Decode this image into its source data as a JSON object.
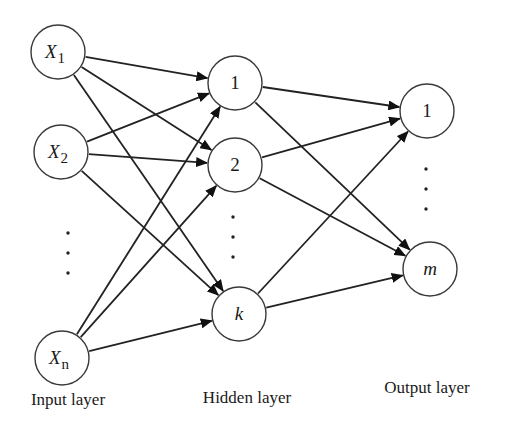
{
  "diagram": {
    "colors": {
      "stroke": "#222222",
      "node_fill": "#ffffff",
      "text": "#1a1a1a",
      "background": "#ffffff"
    },
    "layers": [
      {
        "id": "input",
        "label": "Input layer",
        "label_x": 68,
        "label_y": 405
      },
      {
        "id": "hidden",
        "label": "Hidden layer",
        "label_x": 247,
        "label_y": 403
      },
      {
        "id": "output",
        "label": "Output layer",
        "label_x": 427,
        "label_y": 393
      }
    ],
    "nodes": [
      {
        "id": "x1",
        "layer": "input",
        "main": "X",
        "sub": "1",
        "italic": true,
        "cx": 58,
        "cy": 52,
        "r": 27
      },
      {
        "id": "x2",
        "layer": "input",
        "main": "X",
        "sub": "2",
        "italic": true,
        "cx": 61,
        "cy": 152,
        "r": 27
      },
      {
        "id": "xn",
        "layer": "input",
        "main": "X",
        "sub": "n",
        "italic": true,
        "cx": 62,
        "cy": 358,
        "r": 27
      },
      {
        "id": "h1",
        "layer": "hidden",
        "main": "1",
        "sub": "",
        "italic": false,
        "cx": 235,
        "cy": 83,
        "r": 27
      },
      {
        "id": "h2",
        "layer": "hidden",
        "main": "2",
        "sub": "",
        "italic": false,
        "cx": 235,
        "cy": 165,
        "r": 27
      },
      {
        "id": "hk",
        "layer": "hidden",
        "main": "k",
        "sub": "",
        "italic": true,
        "cx": 239,
        "cy": 314,
        "r": 27
      },
      {
        "id": "o1",
        "layer": "output",
        "main": "1",
        "sub": "",
        "italic": false,
        "cx": 427,
        "cy": 111,
        "r": 27
      },
      {
        "id": "om",
        "layer": "output",
        "main": "m",
        "sub": "",
        "italic": true,
        "cx": 430,
        "cy": 269,
        "r": 27
      }
    ],
    "ellipses": [
      {
        "layer": "input",
        "x": 68,
        "ys": [
          233,
          253,
          273
        ]
      },
      {
        "layer": "hidden",
        "x": 233,
        "ys": [
          217,
          237,
          257
        ]
      },
      {
        "layer": "output",
        "x": 426,
        "ys": [
          169,
          189,
          209
        ]
      }
    ],
    "edges": [
      [
        "x1",
        "h1"
      ],
      [
        "x1",
        "h2"
      ],
      [
        "x1",
        "hk"
      ],
      [
        "x2",
        "h1"
      ],
      [
        "x2",
        "h2"
      ],
      [
        "x2",
        "hk"
      ],
      [
        "xn",
        "h1"
      ],
      [
        "xn",
        "h2"
      ],
      [
        "xn",
        "hk"
      ],
      [
        "h1",
        "o1"
      ],
      [
        "h1",
        "om"
      ],
      [
        "h2",
        "o1"
      ],
      [
        "h2",
        "om"
      ],
      [
        "hk",
        "o1"
      ],
      [
        "hk",
        "om"
      ]
    ]
  }
}
